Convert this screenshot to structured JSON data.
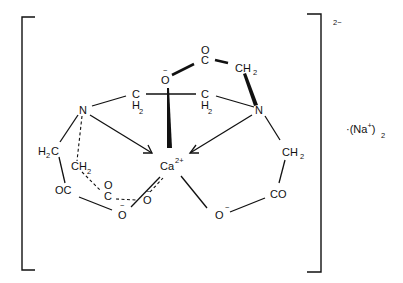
{
  "diagram": {
    "charge": "2−",
    "counterion": {
      "prefix": "·(Na",
      "charge": "+",
      "close": ")",
      "count": "2"
    },
    "atoms": {
      "ca": {
        "symbol": "Ca",
        "charge": "2+"
      },
      "n_left": {
        "symbol": "N"
      },
      "n_right": {
        "symbol": "N"
      },
      "ch2_bridge_left": {
        "symbol": "C",
        "h": "H",
        "sub": "2"
      },
      "ch2_bridge_right": {
        "symbol": "C",
        "h": "H",
        "sub": "2"
      },
      "o_top": {
        "symbol": "O",
        "charge": "−"
      },
      "c_top": {
        "symbol": "C"
      },
      "o_top_carbonyl": {
        "symbol": "O"
      },
      "ch2_top": {
        "symbol": "CH",
        "sub": "2"
      },
      "h2c_left": {
        "symbol": "H",
        "sub": "2",
        "c": "C"
      },
      "ch2_left_back": {
        "symbol": "CH",
        "sub": "2"
      },
      "oc_left": {
        "symbol": "OC"
      },
      "c_left_back": {
        "symbol": "C"
      },
      "o_left_back_carbonyl": {
        "symbol": "O"
      },
      "o_bottom_left": {
        "symbol": "O",
        "charge": "−"
      },
      "o_bottom_mid": {
        "symbol": "O",
        "charge": "−"
      },
      "ch2_right": {
        "symbol": "CH",
        "sub": "2"
      },
      "co_right": {
        "symbol": "CO"
      },
      "o_bottom_right": {
        "symbol": "O",
        "charge": "−"
      }
    }
  }
}
